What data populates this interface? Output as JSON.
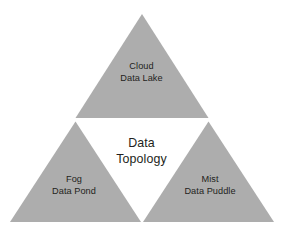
{
  "diagram": {
    "title": "Data Topology",
    "center": {
      "line1": "Data",
      "line2": "Topology"
    },
    "colors": {
      "triangle_fill": "#adadad",
      "background": "#ffffff",
      "text": "#231f20"
    },
    "nodes": [
      {
        "id": "cloud",
        "position": "top",
        "line1": "Cloud",
        "line2": "Data Lake"
      },
      {
        "id": "fog",
        "position": "bottom-left",
        "line1": "Fog",
        "line2": "Data Pond"
      },
      {
        "id": "mist",
        "position": "bottom-right",
        "line1": "Mist",
        "line2": "Data Puddle"
      }
    ]
  }
}
